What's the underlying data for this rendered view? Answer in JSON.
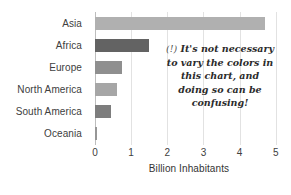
{
  "chart_data": {
    "type": "bar",
    "orientation": "horizontal",
    "title": "",
    "xlabel": "Billion Inhabitants",
    "ylabel": "",
    "categories": [
      "Asia",
      "Africa",
      "Europe",
      "North America",
      "South America",
      "Oceania"
    ],
    "values": [
      4.7,
      1.5,
      0.75,
      0.6,
      0.45,
      0.04
    ],
    "bar_colors": [
      "#b0b0b0",
      "#636363",
      "#8f8f8f",
      "#a6a6a6",
      "#7d7d7d",
      "#969696"
    ],
    "xlim": [
      0,
      5.2
    ],
    "xticks": [
      0,
      1,
      2,
      3,
      4,
      5
    ],
    "xticklabels": [
      "0",
      "1",
      "2",
      "3",
      "4",
      "5"
    ],
    "grid": "vertical",
    "legend": "none",
    "annotations": [
      {
        "marker": "(!)",
        "lines": [
          "It's not necessary",
          "to vary the colors in",
          "this chart, and",
          "doing so can be",
          "confusing!"
        ]
      }
    ]
  },
  "axis": {
    "xlabel": "Billion Inhabitants"
  },
  "annotation": {
    "marker": "(!)",
    "line1": "It's not necessary",
    "line2": "to vary the colors in",
    "line3": "this chart, and",
    "line4": "doing so can be",
    "line5": "confusing!"
  },
  "colors": {
    "grid": "#e2e2e2",
    "axis": "#bdbdbd",
    "text": "#404040"
  }
}
